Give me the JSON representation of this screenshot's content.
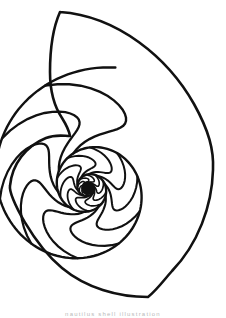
{
  "image": {
    "title": "Nautilus Shell Cross-Section Line Drawing",
    "subject": "nautilus-shell",
    "style": "black-and-white line art / coloring page outline",
    "background_color": "#ffffff",
    "ink_color": "#111111",
    "width": 226,
    "height": 315
  },
  "caption": {
    "text": "nautilus shell illustration",
    "visible": "partially cropped at bottom edge",
    "color": "#b9b9b9"
  },
  "drawing": {
    "outer_outline": {
      "label": "shell outer body whorl outline",
      "apex_point": [
        60,
        12
      ],
      "rightmost_point": [
        213,
        170
      ],
      "bottommost_point": [
        148,
        297
      ],
      "leftmost_point": [
        8,
        196
      ]
    },
    "aperture": {
      "label": "shell aperture opening edge",
      "top": [
        60,
        12
      ],
      "bottom": [
        70,
        136
      ]
    },
    "spiral": {
      "label": "logarithmic spiral of chamber septa",
      "center": [
        88,
        188
      ],
      "growth_factor_per_turn": 2.95,
      "septa_count": 30,
      "turns_drawn": 3.1,
      "core_filled": true,
      "core_radius": 7
    },
    "stroke": {
      "outline_width": 2.6,
      "septa_width_outer": 2.4,
      "septa_width_inner": 1.1
    }
  },
  "chart_data": {
    "type": "line",
    "xlabel": "",
    "ylabel": "",
    "categories": [],
    "values": []
  }
}
